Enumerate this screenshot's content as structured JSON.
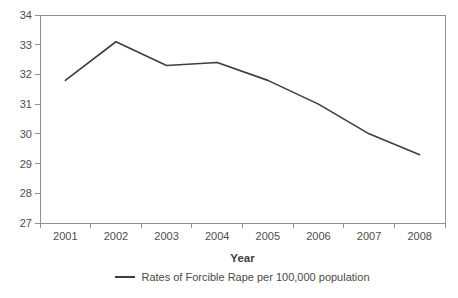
{
  "chart_data": {
    "type": "line",
    "categories": [
      "2001",
      "2002",
      "2003",
      "2004",
      "2005",
      "2006",
      "2007",
      "2008"
    ],
    "series": [
      {
        "name": "Rates of Forcible Rape per 100,000 population",
        "values": [
          31.8,
          33.1,
          32.3,
          32.4,
          31.8,
          31.0,
          30.0,
          29.3
        ]
      }
    ],
    "title": "",
    "xlabel": "Year",
    "ylabel": "",
    "ylim": [
      27,
      34
    ],
    "y_tick_step": 1,
    "y_tick_labels": [
      "27",
      "28",
      "29",
      "30",
      "31",
      "32",
      "33",
      "34"
    ],
    "grid": false,
    "legend_position": "bottom-center",
    "colors": {
      "line": "#3d3d3d",
      "axis": "#919191",
      "tick_text": "#4d4d4d",
      "background": "#ffffff"
    }
  }
}
